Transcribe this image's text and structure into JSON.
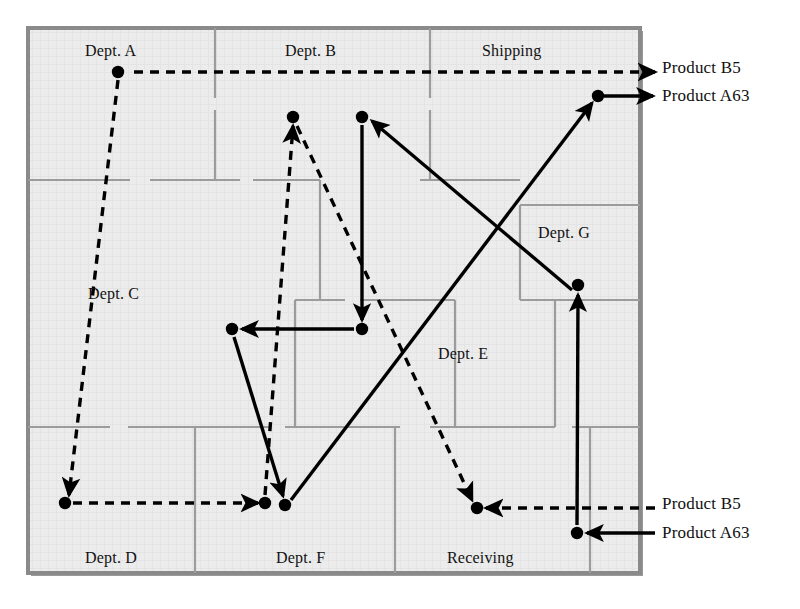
{
  "diagram": {
    "type": "facility-layout-flow",
    "colors": {
      "floor_fill": "#ececec",
      "floor_texture": "#e2e2e2",
      "outer_wall": "#8a8a8a",
      "outer_wall_shadow": "#9a9a9a",
      "inner_wall": "#9c9c9c",
      "flow_line": "#000000",
      "node": "#000000"
    },
    "frame": {
      "x": 28,
      "y": 28,
      "width": 612,
      "height": 545
    }
  },
  "departments": [
    {
      "id": "dept-a",
      "label": "Dept. A",
      "x": 85,
      "y": 42
    },
    {
      "id": "dept-b",
      "label": "Dept. B",
      "x": 285,
      "y": 42
    },
    {
      "id": "shipping",
      "label": "Shipping",
      "x": 482,
      "y": 42
    },
    {
      "id": "dept-g",
      "label": "Dept. G",
      "x": 538,
      "y": 224
    },
    {
      "id": "dept-c",
      "label": "Dept. C",
      "x": 88,
      "y": 285
    },
    {
      "id": "dept-e",
      "label": "Dept. E",
      "x": 438,
      "y": 345
    },
    {
      "id": "dept-d",
      "label": "Dept. D",
      "x": 85,
      "y": 549
    },
    {
      "id": "dept-f",
      "label": "Dept. F",
      "x": 276,
      "y": 549
    },
    {
      "id": "receiving",
      "label": "Receiving",
      "x": 447,
      "y": 549
    }
  ],
  "legend_labels": [
    {
      "id": "product-b5-top",
      "label": "Product B5",
      "x": 662,
      "y": 58,
      "style": "dashed"
    },
    {
      "id": "product-a63-top",
      "label": "Product A63",
      "x": 662,
      "y": 86,
      "style": "solid"
    },
    {
      "id": "product-b5-bottom",
      "label": "Product B5",
      "x": 662,
      "y": 494,
      "style": "dashed"
    },
    {
      "id": "product-a63-bottom",
      "label": "Product A63",
      "x": 662,
      "y": 523,
      "style": "solid"
    }
  ],
  "flow_nodes": [
    {
      "id": "n-a",
      "x": 118,
      "y": 72,
      "product": "B5"
    },
    {
      "id": "n-b-dash",
      "x": 293,
      "y": 117,
      "product": "B5"
    },
    {
      "id": "n-b-solid",
      "x": 362,
      "y": 117,
      "product": "A63"
    },
    {
      "id": "n-ship",
      "x": 598,
      "y": 96,
      "product": "A63"
    },
    {
      "id": "n-g",
      "x": 578,
      "y": 285,
      "product": "A63"
    },
    {
      "id": "n-c",
      "x": 232,
      "y": 329,
      "product": "A63"
    },
    {
      "id": "n-e",
      "x": 362,
      "y": 329,
      "product": "A63"
    },
    {
      "id": "n-d",
      "x": 65,
      "y": 503,
      "product": "B5"
    },
    {
      "id": "n-f-dash",
      "x": 265,
      "y": 503,
      "product": "B5"
    },
    {
      "id": "n-f-solid",
      "x": 285,
      "y": 505,
      "product": "A63"
    },
    {
      "id": "n-recv-b5",
      "x": 477,
      "y": 508,
      "product": "B5"
    },
    {
      "id": "n-recv-a63",
      "x": 577,
      "y": 533,
      "product": "A63"
    }
  ],
  "product_b5_path": {
    "name": "Product B5",
    "style": "dashed",
    "sequence": [
      "entry-right-top",
      "n-a",
      "n-d",
      "n-f-dash",
      "n-b-dash",
      "n-recv-b5",
      "exit-right-bottom"
    ]
  },
  "product_a63_path": {
    "name": "Product A63",
    "style": "solid",
    "sequence": [
      "entry-right-bottom",
      "n-recv-a63",
      "n-g",
      "n-b-solid",
      "n-e",
      "n-c",
      "n-f-solid",
      "n-ship",
      "exit-right-top"
    ]
  },
  "inner_walls": {
    "horizontal": [
      {
        "x1": 28,
        "x2": 130,
        "y": 180
      },
      {
        "x1": 150,
        "x2": 240,
        "y": 180
      },
      {
        "x1": 253,
        "x2": 320,
        "y": 180
      },
      {
        "x1": 420,
        "x2": 520,
        "y": 180
      },
      {
        "x1": 520,
        "x2": 640,
        "y": 205
      },
      {
        "x1": 295,
        "x2": 345,
        "y": 300
      },
      {
        "x1": 360,
        "x2": 455,
        "y": 300
      },
      {
        "x1": 520,
        "x2": 640,
        "y": 300
      },
      {
        "x1": 28,
        "x2": 110,
        "y": 427
      },
      {
        "x1": 128,
        "x2": 270,
        "y": 427
      },
      {
        "x1": 285,
        "x2": 400,
        "y": 427
      },
      {
        "x1": 430,
        "x2": 555,
        "y": 427
      },
      {
        "x1": 572,
        "x2": 640,
        "y": 427
      }
    ],
    "vertical": [
      {
        "y1": 28,
        "y2": 98,
        "x": 215
      },
      {
        "y1": 110,
        "y2": 180,
        "x": 215
      },
      {
        "y1": 28,
        "y2": 98,
        "x": 430
      },
      {
        "y1": 110,
        "y2": 180,
        "x": 430
      },
      {
        "y1": 180,
        "y2": 300,
        "x": 320
      },
      {
        "y1": 205,
        "y2": 300,
        "x": 520
      },
      {
        "y1": 300,
        "y2": 427,
        "x": 295
      },
      {
        "y1": 300,
        "y2": 427,
        "x": 455
      },
      {
        "y1": 300,
        "y2": 427,
        "x": 555
      },
      {
        "y1": 427,
        "y2": 573,
        "x": 195
      },
      {
        "y1": 427,
        "y2": 573,
        "x": 395
      },
      {
        "y1": 427,
        "y2": 573,
        "x": 590
      }
    ]
  }
}
